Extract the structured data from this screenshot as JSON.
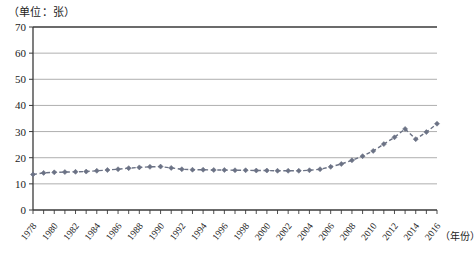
{
  "chart_data": {
    "type": "line",
    "title": "",
    "unit_label": "（单位：张）",
    "xlabel": "（年份）",
    "ylabel": "",
    "ylim": [
      0,
      70
    ],
    "ytick_step": 10,
    "yticks": [
      0,
      10,
      20,
      30,
      40,
      50,
      60,
      70
    ],
    "xlim": [
      1978,
      2016
    ],
    "xticks_labeled": [
      "1978",
      "1980",
      "1982",
      "1984",
      "1986",
      "1988",
      "1990",
      "1992",
      "1994",
      "1996",
      "1998",
      "2000",
      "2002",
      "2004",
      "2006",
      "2008",
      "2010",
      "2012",
      "2014",
      "2016"
    ],
    "xtick_interval_years": 1,
    "xlabel_interval_years": 2,
    "grid": true,
    "grid_axis": "y",
    "legend": "none",
    "marker": "diamond",
    "line_style": "dashed",
    "series_color": "#6b7285",
    "grid_color": "#9a9a9a",
    "axis_color": "#3a3a3a",
    "x": [
      1978,
      1979,
      1980,
      1981,
      1982,
      1983,
      1984,
      1985,
      1986,
      1987,
      1988,
      1989,
      1990,
      1991,
      1992,
      1993,
      1994,
      1995,
      1996,
      1997,
      1998,
      1999,
      2000,
      2001,
      2002,
      2003,
      2004,
      2005,
      2006,
      2007,
      2008,
      2009,
      2010,
      2011,
      2012,
      2013,
      2014,
      2015,
      2016
    ],
    "values": [
      13.6,
      14.2,
      14.4,
      14.5,
      14.6,
      14.7,
      15.0,
      15.3,
      15.6,
      16.0,
      16.3,
      16.5,
      16.6,
      16.1,
      15.6,
      15.4,
      15.4,
      15.3,
      15.3,
      15.2,
      15.2,
      15.1,
      15.1,
      15.0,
      15.0,
      15.0,
      15.2,
      15.6,
      16.5,
      17.6,
      19.0,
      20.6,
      22.6,
      25.2,
      27.8,
      31.0,
      27.1,
      29.8,
      33.0
    ]
  }
}
